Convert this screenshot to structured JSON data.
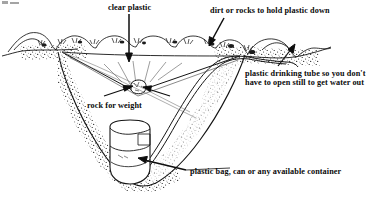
{
  "figure": {
    "background_color": "#ffffff",
    "ink_color": "#111111",
    "labels": {
      "clear_plastic": "clear plastic",
      "dirt_or_rocks": "dirt or rocks to hold plastic down",
      "drinking_tube_line1": "plastic drinking tube so you don't",
      "drinking_tube_line2": "have to open still to get water out",
      "rock_for_weight": "rock for weight",
      "container": "plastic bag, can or any available container"
    },
    "parts": {
      "plastic_sheet": "clear-plastic-sheet",
      "weight_rock": "rock-for-weight",
      "pit": "dug-pit",
      "soil": "stippled-soil",
      "surface_rocks": "dirt-and-rocks-on-rim",
      "tube": "plastic-drinking-tube",
      "collector": "collection-container"
    }
  }
}
